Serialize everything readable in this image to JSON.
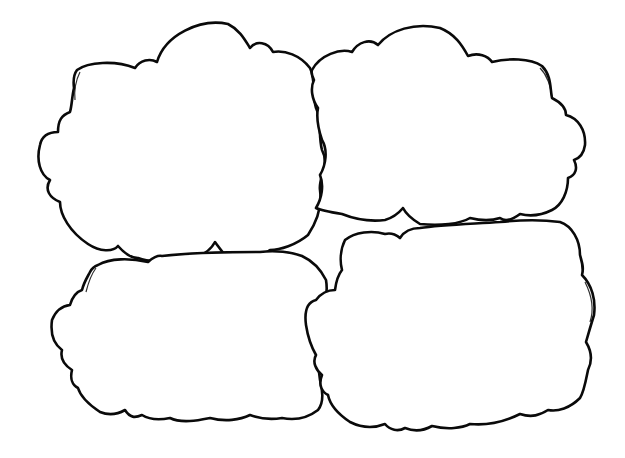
{
  "colors": {
    "background": "#ffffff",
    "stroke": "#0a0a0a"
  },
  "clouds": [
    {
      "name": "top-left",
      "label": ""
    },
    {
      "name": "top-right",
      "label": ""
    },
    {
      "name": "bottom-left",
      "label": ""
    },
    {
      "name": "bottom-right",
      "label": ""
    }
  ]
}
